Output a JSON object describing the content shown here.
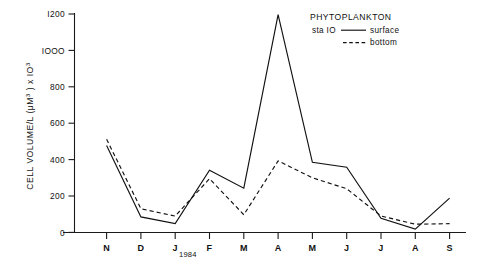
{
  "chart_data": {
    "type": "line",
    "title": "",
    "xlabel": "",
    "ylabel": "CELL VOLUME/L (μM3) x 103",
    "ylabel_parts": {
      "main": "CELL  VOLUME/L  (μM",
      "sup1": "3",
      "mid": " )  x  IO",
      "sup2": "3"
    },
    "categories": [
      "N",
      "D",
      "J",
      "F",
      "M",
      "A",
      "M",
      "J",
      "J",
      "A",
      "S"
    ],
    "x_tick_labels": [
      "N",
      "D",
      "J",
      "F",
      "M",
      "A",
      "M",
      "J",
      "J",
      "A",
      "S"
    ],
    "x_annotation": "1984",
    "x_annotation_after": "J",
    "ylim": [
      0,
      1200
    ],
    "y_ticks": [
      0,
      200,
      400,
      600,
      800,
      1000,
      1200
    ],
    "y_tick_labels": [
      "0",
      "200",
      "400",
      "600",
      "800",
      "IOOO",
      "I200"
    ],
    "grid": false,
    "legend_position": "top-right",
    "series": [
      {
        "name": "surface",
        "style": "solid",
        "values": [
          478,
          85,
          48,
          342,
          243,
          1196,
          385,
          358,
          78,
          18,
          188
        ]
      },
      {
        "name": "bottom",
        "style": "dashed",
        "values": [
          512,
          130,
          90,
          295,
          97,
          393,
          300,
          240,
          90,
          45,
          48
        ]
      }
    ]
  },
  "legend": {
    "title": "PHYTOPLANKTON",
    "station_label": "sta IO",
    "entries": [
      {
        "label": "surface",
        "style": "solid"
      },
      {
        "label": "bottom",
        "style": "dashed"
      }
    ]
  },
  "colors": {
    "ink": "#111111",
    "background": "#ffffff"
  }
}
